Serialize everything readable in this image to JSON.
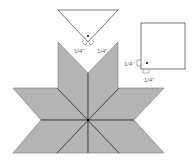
{
  "diagram": {
    "colors": {
      "diamond_fill": "#b4b4b4",
      "outline": "#555555",
      "seam": "#333333",
      "label": "#6a6a6a"
    },
    "triangle": {
      "labels": {
        "left": "1/4\"",
        "right": "1/4\""
      }
    },
    "square": {
      "labels": {
        "left": "1/4\"",
        "bottom": "1/4\""
      }
    }
  }
}
